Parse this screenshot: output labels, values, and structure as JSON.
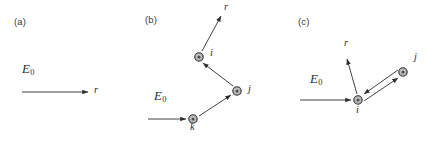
{
  "figure": {
    "width": 440,
    "height": 142,
    "background": "#ffffff",
    "line_color": "#2e2e2e",
    "node_fill": "#b3b3b3",
    "node_stroke": "#2e2e2e",
    "node_core": "#4a4a4a",
    "text_color": "#2e2e2e"
  },
  "panels": [
    {
      "id": "a",
      "label": "(a)",
      "incident_field_label": "E",
      "incident_field_sub": "0",
      "output_label": "r",
      "nodes": [],
      "description": "incident field arrow pointing right to observation direction r"
    },
    {
      "id": "b",
      "label": "(b)",
      "incident_field_label": "E",
      "incident_field_sub": "0",
      "output_label": "r",
      "nodes": [
        {
          "name": "k",
          "label": "k",
          "x": 193,
          "y": 119
        },
        {
          "name": "j",
          "label": "j",
          "x": 237,
          "y": 91
        },
        {
          "name": "i",
          "label": "i",
          "x": 199,
          "y": 57
        }
      ],
      "path": [
        "E0",
        "k",
        "j",
        "i",
        "r"
      ],
      "description": "three-node sequential scattering chain k to j to i then out to r"
    },
    {
      "id": "c",
      "label": "(c)",
      "incident_field_label": "E",
      "incident_field_sub": "0",
      "output_label": "r",
      "nodes": [
        {
          "name": "i",
          "label": "i",
          "x": 358,
          "y": 100
        },
        {
          "name": "j",
          "label": "j",
          "x": 403,
          "y": 72
        }
      ],
      "path": [
        "E0",
        "i",
        "j",
        "i",
        "r"
      ],
      "description": "two-node recurrent scattering, i to j and back to j to i, then out to r"
    }
  ]
}
